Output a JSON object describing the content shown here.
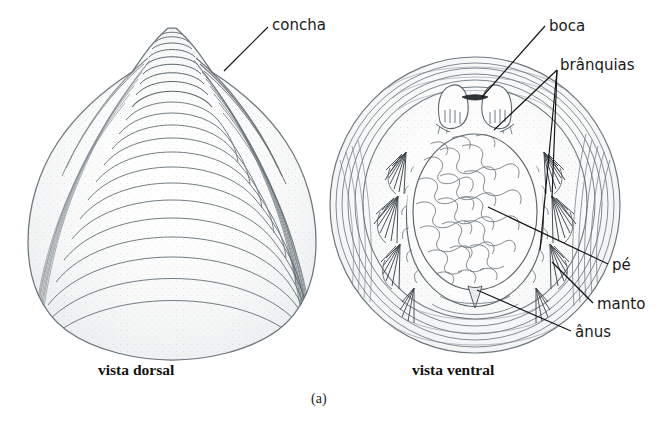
{
  "figure": {
    "background_color": "#ffffff",
    "ink_color": "#555f66",
    "leader_color": "#111111",
    "subcaption": "(a)",
    "width": 670,
    "height": 446
  },
  "views": [
    {
      "id": "dorsal",
      "caption": "vista dorsal",
      "caption_x": 98,
      "caption_y": 362
    },
    {
      "id": "ventral",
      "caption": "vista ventral",
      "caption_x": 412,
      "caption_y": 362
    }
  ],
  "labels": [
    {
      "id": "concha",
      "text": "concha",
      "x": 272,
      "y": 18,
      "target": "dorsal shell surface"
    },
    {
      "id": "boca",
      "text": "boca",
      "x": 549,
      "y": 19,
      "target": "mouth between labial palps"
    },
    {
      "id": "branquias",
      "text": "brânquias",
      "x": 560,
      "y": 58,
      "target": "gill filaments"
    },
    {
      "id": "pe",
      "text": "pé",
      "x": 612,
      "y": 258,
      "target": "foot"
    },
    {
      "id": "manto",
      "text": "manto",
      "x": 597,
      "y": 297,
      "target": "mantle margin"
    },
    {
      "id": "anus",
      "text": "ânus",
      "x": 575,
      "y": 325,
      "target": "anus notch"
    }
  ]
}
